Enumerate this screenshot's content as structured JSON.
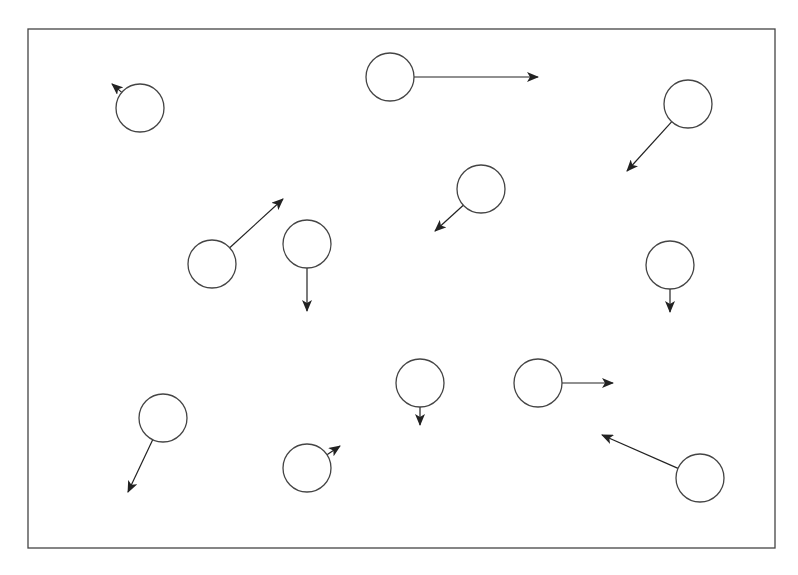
{
  "diagram": {
    "width": 798,
    "height": 575,
    "stroke_color": "#444444",
    "arrow_color": "#222222",
    "frame": {
      "x1": 28,
      "y1": 29,
      "x2": 775,
      "y2": 548
    },
    "particle_radius": 24,
    "particles": [
      {
        "id": 1,
        "cx": 140,
        "cy": 108,
        "vx": 112,
        "vy": 84
      },
      {
        "id": 2,
        "cx": 390,
        "cy": 77,
        "vx": 538,
        "vy": 77
      },
      {
        "id": 3,
        "cx": 688,
        "cy": 104,
        "vx": 627,
        "vy": 171
      },
      {
        "id": 4,
        "cx": 481,
        "cy": 189,
        "vx": 435,
        "vy": 231
      },
      {
        "id": 5,
        "cx": 212,
        "cy": 264,
        "vx": 283,
        "vy": 199
      },
      {
        "id": 6,
        "cx": 307,
        "cy": 244,
        "vx": 307,
        "vy": 311
      },
      {
        "id": 7,
        "cx": 670,
        "cy": 265,
        "vx": 670,
        "vy": 312
      },
      {
        "id": 8,
        "cx": 163,
        "cy": 418,
        "vx": 128,
        "vy": 492
      },
      {
        "id": 9,
        "cx": 420,
        "cy": 383,
        "vx": 420,
        "vy": 425
      },
      {
        "id": 10,
        "cx": 538,
        "cy": 383,
        "vx": 613,
        "vy": 383
      },
      {
        "id": 11,
        "cx": 307,
        "cy": 468,
        "vx": 340,
        "vy": 446
      },
      {
        "id": 12,
        "cx": 700,
        "cy": 478,
        "vx": 602,
        "vy": 435
      }
    ]
  }
}
